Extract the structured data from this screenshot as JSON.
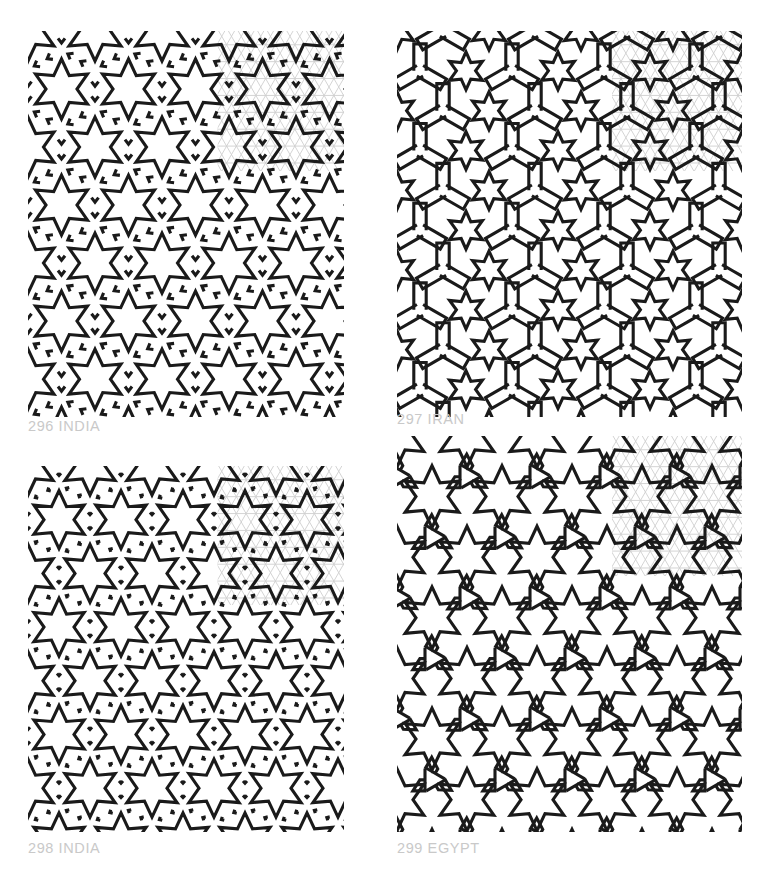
{
  "page": {
    "background_color": "#ffffff",
    "width": 771,
    "height": 888
  },
  "style": {
    "line_color": "#1a1a1a",
    "grid_color": "#cfcfcf",
    "label_color": "#c9c9c9",
    "line_width": 3.1,
    "grid_line_width": 0.9
  },
  "panels": [
    {
      "id": "296",
      "number": "296",
      "country": "INDIA",
      "label": "296 INDIA",
      "pattern_type": "six-pointed-star-interlace",
      "grid": "triangular",
      "grid_spacing": 19.5,
      "star_points": 6,
      "overlay_grid_corner": "top-right",
      "x": 28,
      "y": 31,
      "width": 316,
      "height": 386
    },
    {
      "id": "297",
      "number": "297",
      "country": "IRAN",
      "label": "297 IRAN",
      "pattern_type": "dense-star-and-zigzag-interlace",
      "grid": "triangular",
      "grid_spacing": 19.5,
      "star_points": 6,
      "overlay_grid_corner": "top-right",
      "x": 397,
      "y": 31,
      "width": 345,
      "height": 386
    },
    {
      "id": "298",
      "number": "298",
      "country": "INDIA",
      "label": "298 INDIA",
      "pattern_type": "six-pointed-star-lattice",
      "grid": "triangular",
      "grid_spacing": 19.5,
      "star_points": 6,
      "overlay_grid_corner": "top-right",
      "x": 28,
      "y": 466,
      "width": 316,
      "height": 366
    },
    {
      "id": "299",
      "number": "299",
      "country": "EGYPT",
      "label": "299 EGYPT",
      "pattern_type": "star-and-pinwheel-interlace",
      "grid": "triangular",
      "grid_spacing": 19.5,
      "star_points": 6,
      "overlay_grid_corner": "top-right",
      "x": 397,
      "y": 436,
      "width": 345,
      "height": 396
    }
  ]
}
